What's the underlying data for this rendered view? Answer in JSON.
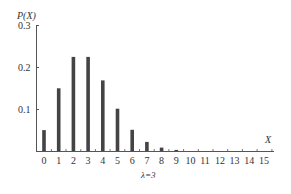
{
  "chart_data": {
    "type": "bar",
    "title": "",
    "ylabel": "P(X)",
    "xlabel": "X",
    "annotation": "λ=3",
    "categories": [
      "0",
      "1",
      "2",
      "3",
      "4",
      "5",
      "6",
      "7",
      "8",
      "9",
      "10",
      "11",
      "12",
      "13",
      "14",
      "15"
    ],
    "values": [
      0.0498,
      0.1494,
      0.224,
      0.224,
      0.168,
      0.1008,
      0.0504,
      0.0216,
      0.0081,
      0.0027,
      0.0008,
      0.0002,
      0.0001,
      0.0,
      0.0,
      0.0
    ],
    "yticks": [
      "0.1",
      "0.2",
      "0.3"
    ],
    "ylim": [
      0,
      0.3
    ],
    "grid": false,
    "legend": null,
    "bar_color": "#444444"
  },
  "labels": {
    "ylabel": "P(X)",
    "xlabel": "X",
    "lambda": "λ=3",
    "ytick_01": "0.1",
    "ytick_02": "0.2",
    "ytick_03": "0.3"
  }
}
